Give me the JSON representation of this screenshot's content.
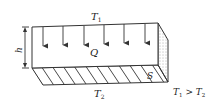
{
  "diagram": {
    "labels": {
      "top_temp": "T",
      "top_temp_sub": "1",
      "bottom_temp": "T",
      "bottom_temp_sub": "2",
      "heat": "Q",
      "thickness": "h",
      "area": "S",
      "condition_a": "T",
      "condition_a_sub": "1",
      "condition_op": " > ",
      "condition_b": "T",
      "condition_b_sub": "2"
    },
    "heat_arrow_count": 6,
    "colors": {
      "line": "#333333",
      "background": "#ffffff"
    }
  }
}
